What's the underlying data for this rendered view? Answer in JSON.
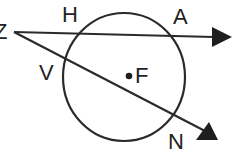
{
  "diagram": {
    "type": "geometry",
    "stroke_color": "#2a2a2a",
    "circle": {
      "center_label": "F",
      "cx": 124,
      "cy": 77,
      "rx": 61,
      "ry": 64
    },
    "vertex": {
      "label": "Z",
      "x": 14,
      "y": 32
    },
    "rays": [
      {
        "name": "ZA",
        "from": "Z",
        "through": [
          "H",
          "A"
        ],
        "tip": [
          231,
          37
        ]
      },
      {
        "name": "ZN",
        "from": "Z",
        "through": [
          "V",
          "N"
        ],
        "tip": [
          217,
          139
        ]
      }
    ],
    "labels": {
      "Z": "Z",
      "H": "H",
      "A": "A",
      "V": "V",
      "F": "F",
      "N": "N"
    }
  }
}
